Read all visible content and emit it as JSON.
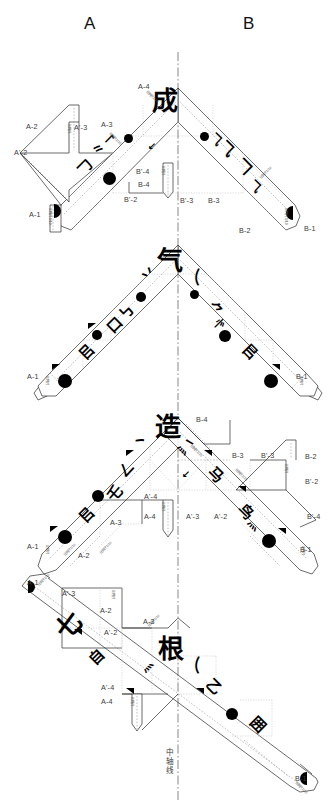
{
  "header": {
    "left_label": "A",
    "right_label": "B"
  },
  "axis": {
    "caption": "中轴线",
    "chars": [
      "中",
      "轴",
      "线"
    ]
  },
  "panels": [
    {
      "id": "panel-1",
      "character": "成",
      "labels": [
        {
          "text": "A-4",
          "x": 138,
          "y": 82
        },
        {
          "text": "A-3",
          "x": 101,
          "y": 120
        },
        {
          "text": "A-2",
          "x": 26,
          "y": 122
        },
        {
          "text": "A'-3",
          "x": 74,
          "y": 123
        },
        {
          "text": "A'-2",
          "x": 14,
          "y": 148
        },
        {
          "text": "A-1",
          "x": 29,
          "y": 210
        },
        {
          "text": "B'-4",
          "x": 136,
          "y": 167
        },
        {
          "text": "B-4",
          "x": 138,
          "y": 180
        },
        {
          "text": "B'-2",
          "x": 124,
          "y": 195
        },
        {
          "text": "B'-3",
          "x": 180,
          "y": 196
        },
        {
          "text": "B-3",
          "x": 208,
          "y": 196
        },
        {
          "text": "B-2",
          "x": 239,
          "y": 226
        },
        {
          "text": "B-1",
          "x": 304,
          "y": 224
        }
      ]
    },
    {
      "id": "panel-2",
      "character": "气",
      "labels": [
        {
          "text": "A-1",
          "x": 27,
          "y": 372
        },
        {
          "text": "B-1",
          "x": 296,
          "y": 372
        }
      ]
    },
    {
      "id": "panel-3",
      "character": "造",
      "labels": [
        {
          "text": "B-4",
          "x": 196,
          "y": 415
        },
        {
          "text": "B-3",
          "x": 232,
          "y": 451
        },
        {
          "text": "B'-3",
          "x": 261,
          "y": 451
        },
        {
          "text": "B-2",
          "x": 305,
          "y": 452
        },
        {
          "text": "B'-2",
          "x": 305,
          "y": 477
        },
        {
          "text": "B'-4",
          "x": 307,
          "y": 512
        },
        {
          "text": "B-1",
          "x": 300,
          "y": 545
        },
        {
          "text": "A'-4",
          "x": 144,
          "y": 492
        },
        {
          "text": "A-4",
          "x": 144,
          "y": 512
        },
        {
          "text": "A'-3",
          "x": 186,
          "y": 512
        },
        {
          "text": "A'-2",
          "x": 214,
          "y": 512
        },
        {
          "text": "A-3",
          "x": 110,
          "y": 518
        },
        {
          "text": "A-1",
          "x": 27,
          "y": 542
        },
        {
          "text": "A-2",
          "x": 78,
          "y": 551
        }
      ]
    },
    {
      "id": "panel-4",
      "character": "根",
      "labels": [
        {
          "text": "A-1",
          "x": 27,
          "y": 578
        },
        {
          "text": "A'-3",
          "x": 62,
          "y": 589
        },
        {
          "text": "A-2",
          "x": 100,
          "y": 606
        },
        {
          "text": "A'-2",
          "x": 104,
          "y": 628
        },
        {
          "text": "A-3",
          "x": 143,
          "y": 617
        },
        {
          "text": "A'-4",
          "x": 101,
          "y": 683
        },
        {
          "text": "A-4",
          "x": 101,
          "y": 697
        },
        {
          "text": "B-1",
          "x": 295,
          "y": 774
        }
      ]
    }
  ],
  "tick_marks": {
    "sample": "比例尺",
    "count_note": ""
  },
  "colors": {
    "line": "#2b2b2b",
    "dash": "#8a8a8a",
    "ink": "#000000",
    "label": "#3a3a3a"
  }
}
